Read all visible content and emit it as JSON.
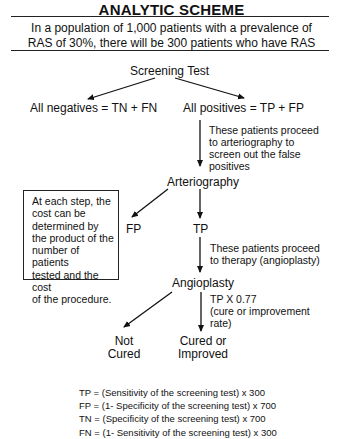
{
  "title": "ANALYTIC SCHEME",
  "intro": {
    "line1": "In a population of 1,000 patients with a prevalence of",
    "line2": "RAS of 30%, there will be 300 patients who have RAS"
  },
  "nodes": {
    "screening_test": "Screening Test",
    "all_negatives": "All negatives = TN + FN",
    "all_positives": "All positives = TP + FP",
    "arteriography": "Arteriography",
    "fp": "FP",
    "tp": "TP",
    "angioplasty": "Angioplasty",
    "not_cured_line1": "Not",
    "not_cured_line2": "Cured",
    "cured_line1": "Cured or",
    "cured_line2": "Improved"
  },
  "notes": {
    "to_arteriography": [
      "These patients proceed",
      "to arteriography to",
      "screen out the false",
      "positives"
    ],
    "to_therapy": [
      "These patients proceed",
      "to therapy (angioplasty)"
    ],
    "cure_rate": [
      "TP X 0.77",
      "(cure or improvement",
      "rate)"
    ]
  },
  "cost_box": [
    "At each step, the",
    "cost can be",
    "determined by",
    "the product of the",
    "number of patients",
    "tested and the cost",
    "of the procedure."
  ],
  "definitions": [
    "TP = (Sensitivity of the screening test) x 300",
    "FP = (1- Specificity of the screening test) x 700",
    "TN = (Specificity of the screening test) x 700",
    "FN = (1- Sensitivity of the screening test) x 300"
  ],
  "population": {
    "total_patients": 1000,
    "prevalence_percent": 30,
    "patients_with_ras": 300,
    "patients_without_ras": 700,
    "cure_rate": 0.77
  }
}
